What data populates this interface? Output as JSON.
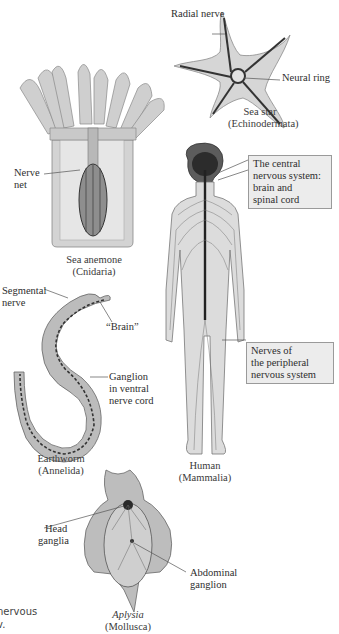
{
  "figure": {
    "organisms": [
      {
        "id": "sea-star",
        "name": "Sea star",
        "phylum": "(Echinodermata)",
        "labels": [
          "Radial nerve",
          "Neural ring"
        ]
      },
      {
        "id": "sea-anemone",
        "name": "Sea anemone",
        "phylum": "(Cnidaria)",
        "labels": [
          "Nerve",
          "net"
        ]
      },
      {
        "id": "human",
        "name": "Human",
        "phylum": "(Mammalia)",
        "boxes": [
          {
            "lines": [
              "The central",
              "nervous system:",
              "brain and",
              "spinal cord"
            ]
          },
          {
            "lines": [
              "Nerves of",
              "the peripheral",
              "nervous system"
            ]
          }
        ]
      },
      {
        "id": "earthworm",
        "name": "Earthworm",
        "phylum": "(Annelida)",
        "labels": [
          "Segmental",
          "nerve",
          "“Brain”",
          "Ganglion",
          "in ventral",
          "nerve cord"
        ]
      },
      {
        "id": "aplysia",
        "name": "Aplysia",
        "phylum": "(Mollusca)",
        "labels": [
          "Head",
          "ganglia",
          "Abdominal",
          "ganglion"
        ]
      }
    ],
    "side_text": [
      "nervous",
      "v."
    ]
  },
  "colors": {
    "background": "#ffffff",
    "body_fill": "#d9d9d9",
    "nerve": "#2a2a2a",
    "label_box": "#ececec"
  }
}
